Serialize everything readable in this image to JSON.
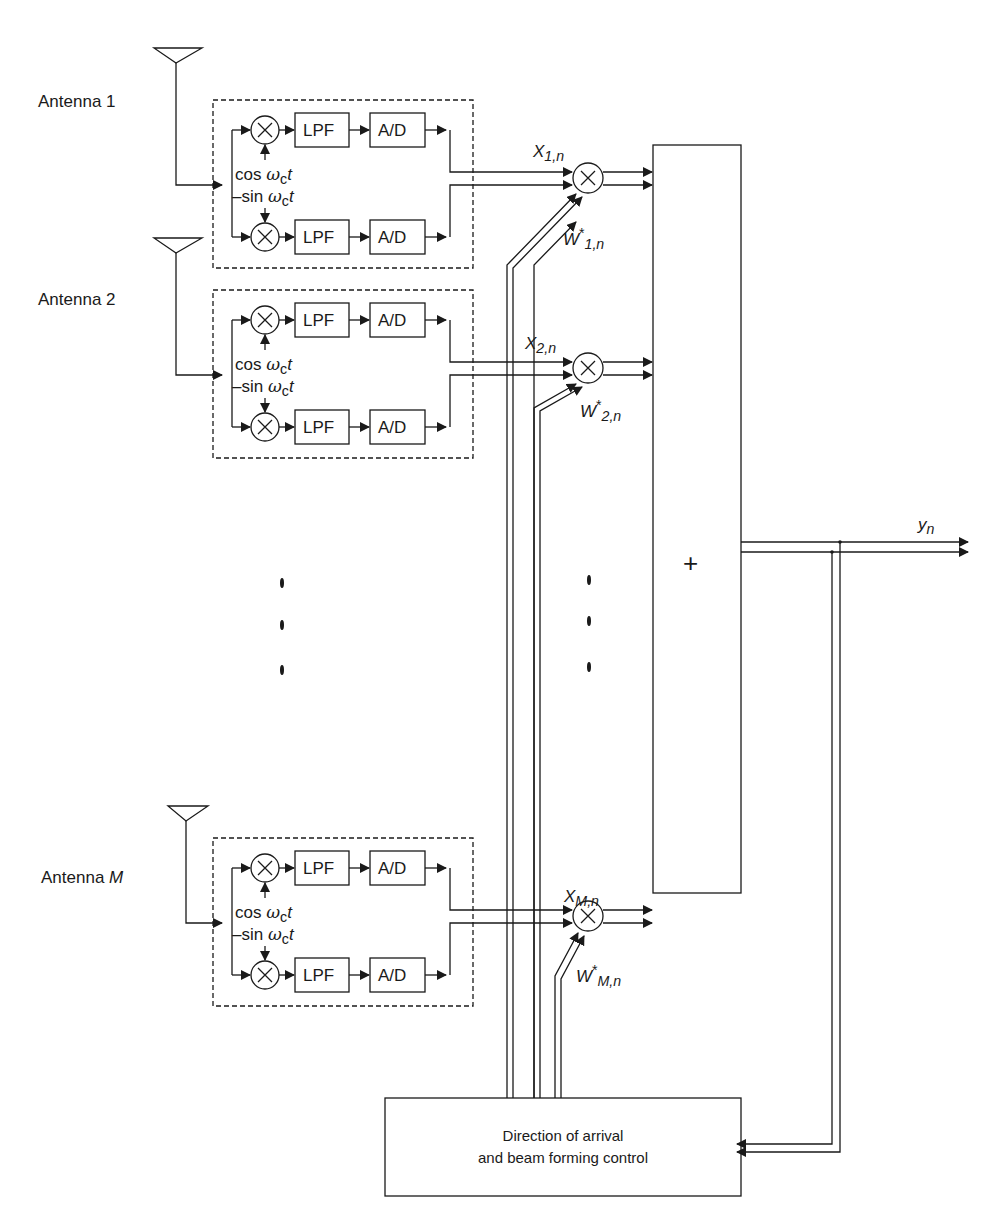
{
  "diagram": {
    "title": "",
    "antennas": [
      {
        "label": "Antenna 1",
        "x_signal": "X",
        "x_sub": "1,n",
        "w_signal": "W",
        "w_sup": "*",
        "w_sub": "1,n"
      },
      {
        "label": "Antenna 2",
        "x_signal": "X",
        "x_sub": "2,n",
        "w_signal": "W",
        "w_sup": "*",
        "w_sub": "2,n"
      },
      {
        "label_prefix": "Antenna ",
        "label_var": "M",
        "x_signal": "X",
        "x_sub": "M,n",
        "w_signal": "W",
        "w_sup": "*",
        "w_sub": "M,n"
      }
    ],
    "blocks": {
      "lpf": "LPF",
      "adc": "A/D",
      "mixer_symbol": "×",
      "cos_label_prefix": "cos ",
      "cos_label_var": "ω",
      "cos_label_sub": "c",
      "cos_label_t": "t",
      "sin_label_prefix": "–sin ",
      "sin_label_var": "ω",
      "sin_label_sub": "c",
      "sin_label_t": "t"
    },
    "summer_symbol": "+",
    "output": {
      "label": "y",
      "sub": "n"
    },
    "control_block": {
      "line1": "Direction of arrival",
      "line2": "and beam forming control"
    },
    "ellipsis": "⋮"
  }
}
